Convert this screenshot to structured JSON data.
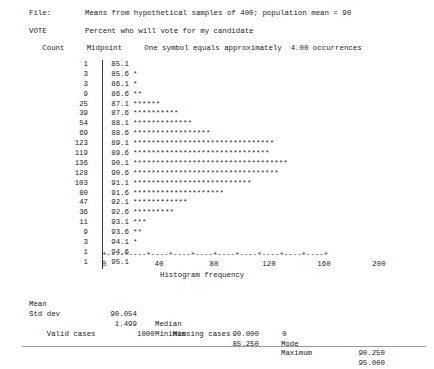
{
  "report": {
    "file_label": "File:",
    "file_description": "Means from hypothetical samples of 400; population mean = 90",
    "variable_name": "VOTE",
    "variable_description": "Percent who will vote for my candidate",
    "column_header": "   Count     Midpoint     One symbol equals approximately  4.00 occurrences",
    "count_header": "Count",
    "midpoint_header": "Midpoint",
    "symbol_note": "One symbol equals approximately  4.00 occurrences",
    "symbol_scale": "4.00",
    "symbol_char": "*"
  },
  "chart_data": {
    "type": "bar",
    "orientation": "horizontal",
    "title": "",
    "xlabel": "Histogram frequency",
    "ylabel": "Midpoint",
    "xlim": [
      0,
      200
    ],
    "xticks": [
      0,
      40,
      80,
      120,
      160,
      200
    ],
    "xtick_labels": [
      "0",
      "40",
      "80",
      "120",
      "160",
      "200"
    ],
    "tick_interval": 20,
    "grid": false,
    "legend": "none",
    "symbol_unit": 4.0,
    "categories": [
      "85.1",
      "85.6",
      "86.1",
      "86.6",
      "87.1",
      "87.6",
      "88.1",
      "88.6",
      "89.1",
      "89.6",
      "90.1",
      "90.6",
      "91.1",
      "91.6",
      "92.1",
      "92.6",
      "93.1",
      "93.6",
      "94.1",
      "94.6",
      "95.1"
    ],
    "values": [
      1,
      3,
      3,
      9,
      25,
      39,
      54,
      69,
      123,
      119,
      136,
      128,
      103,
      80,
      47,
      36,
      11,
      9,
      3,
      1,
      1
    ],
    "symbol_counts": [
      0,
      1,
      1,
      2,
      6,
      10,
      13,
      17,
      31,
      30,
      34,
      32,
      26,
      20,
      12,
      9,
      3,
      2,
      1,
      0,
      0
    ],
    "rows": [
      {
        "count": "1",
        "midpoint": "85.1",
        "bar": ""
      },
      {
        "count": "3",
        "midpoint": "85.6",
        "bar": "*"
      },
      {
        "count": "3",
        "midpoint": "86.1",
        "bar": "*"
      },
      {
        "count": "9",
        "midpoint": "86.6",
        "bar": "**"
      },
      {
        "count": "25",
        "midpoint": "87.1",
        "bar": "******"
      },
      {
        "count": "39",
        "midpoint": "87.6",
        "bar": "**********"
      },
      {
        "count": "54",
        "midpoint": "88.1",
        "bar": "*************"
      },
      {
        "count": "69",
        "midpoint": "88.6",
        "bar": "*****************"
      },
      {
        "count": "123",
        "midpoint": "89.1",
        "bar": "*******************************"
      },
      {
        "count": "119",
        "midpoint": "89.6",
        "bar": "******************************"
      },
      {
        "count": "136",
        "midpoint": "90.1",
        "bar": "**********************************"
      },
      {
        "count": "128",
        "midpoint": "90.6",
        "bar": "********************************"
      },
      {
        "count": "103",
        "midpoint": "91.1",
        "bar": "**************************"
      },
      {
        "count": "80",
        "midpoint": "91.6",
        "bar": "********************"
      },
      {
        "count": "47",
        "midpoint": "92.1",
        "bar": "************"
      },
      {
        "count": "36",
        "midpoint": "92.6",
        "bar": "*********"
      },
      {
        "count": "11",
        "midpoint": "93.1",
        "bar": "***"
      },
      {
        "count": "9",
        "midpoint": "93.6",
        "bar": "**"
      },
      {
        "count": "3",
        "midpoint": "94.1",
        "bar": "*"
      },
      {
        "count": "1",
        "midpoint": "94.6",
        "bar": ""
      },
      {
        "count": "1",
        "midpoint": "95.1",
        "bar": ""
      }
    ],
    "axis_tick_row": "+----+----+----+----+----+----+----+----+----+----+"
  },
  "statistics": {
    "mean_label": "Mean",
    "mean_value": "90.054",
    "median_label": "Median",
    "median_value": "90.000",
    "mode_label": "Mode",
    "mode_value": "90.250",
    "stddev_label": "Std dev",
    "stddev_value": "1.499",
    "minimum_label": "Minimum",
    "minimum_value": "85.250",
    "maximum_label": "Maximum",
    "maximum_value": "95.000",
    "valid_cases_label": "Valid cases",
    "valid_cases_value": "1000",
    "missing_cases_label": "Missing cases",
    "missing_cases_value": "0"
  },
  "colors": {
    "text": "#1b1b1b",
    "axis": "#3a3a3a",
    "rule": "#9a9a9a",
    "background": "#ffffff"
  }
}
